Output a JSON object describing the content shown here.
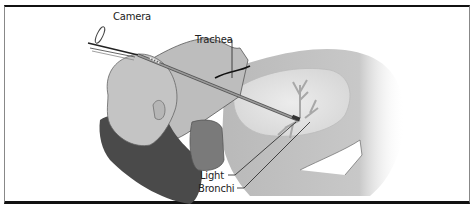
{
  "figure": {
    "labels": {
      "camera": "Camera",
      "trachea": "Trachea",
      "light": "Light",
      "bronchi": "Bronchi"
    },
    "colors": {
      "skin": "#c8c8c8",
      "hair": "#4a4a4a",
      "neck_shadow": "#7a7a7a",
      "lung": "#e2e2e2",
      "border": "#111111"
    }
  }
}
